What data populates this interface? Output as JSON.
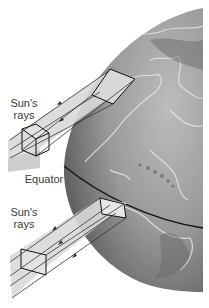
{
  "figure": {
    "labels": {
      "rays_top": [
        "Sun's",
        "rays"
      ],
      "rays_bottom": [
        "Sun's",
        "rays"
      ],
      "equator": "Equator"
    },
    "colors": {
      "background": "#ffffff",
      "globe_light": "#c8c8c8",
      "globe_dark": "#5a5a5a",
      "beam_fill": "#d9d9d9",
      "lines": "#1a1a1a",
      "text": "#3a3a3a"
    }
  }
}
